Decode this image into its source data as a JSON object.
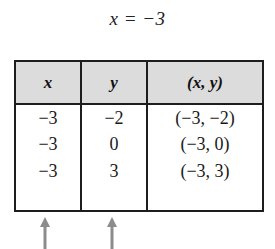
{
  "caption": {
    "equation": "x = −3"
  },
  "table": {
    "headers": [
      "x",
      "y",
      "(x, y)"
    ],
    "rows": [
      {
        "x": "−3",
        "y": "−2",
        "point": "(−3, −2)"
      },
      {
        "x": "−3",
        "y": "0",
        "point": "(−3, 0)"
      },
      {
        "x": "−3",
        "y": "3",
        "point": "(−3, 3)"
      }
    ],
    "colors": {
      "header_background": "#dcdcdc",
      "border": "#1d1d1d",
      "body_background": "#ffffff",
      "text": "#1a1a1a"
    }
  },
  "annotations": {
    "arrows": [
      {
        "name": "arrow-pointing-to-x-column",
        "glyph": "↑",
        "color": "#8c8c8c"
      },
      {
        "name": "arrow-pointing-to-y-column",
        "glyph": "↑",
        "color": "#8c8c8c"
      }
    ]
  }
}
